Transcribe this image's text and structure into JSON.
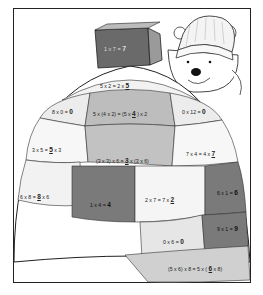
{
  "worksheet": {
    "frame": {
      "border_color": "#222222"
    },
    "book": {
      "equation": "1 x 7 = ",
      "answer": "7",
      "color": "#6a6a6a"
    },
    "bear": {
      "description": "bear in knit hat holding book"
    },
    "blocks": [
      {
        "id": "r1c1",
        "equation_pre": "5 x 2 = 2 x ",
        "answer": "5",
        "equation_post": "",
        "shade": "#f2f2f2"
      },
      {
        "id": "r2c1",
        "equation_pre": "8 x 0 = ",
        "answer": "0",
        "equation_post": "",
        "shade": "#ececec"
      },
      {
        "id": "r2c2",
        "equation_pre": "5 x (4 x 2) = (5 x ",
        "answer": "4",
        "equation_post": " ) x 2",
        "shade": "#bdbdbd"
      },
      {
        "id": "r2c3",
        "equation_pre": "0 x 12 = ",
        "answer": "0",
        "equation_post": "",
        "shade": "#ececec"
      },
      {
        "id": "r3c1",
        "equation_pre": "3 x 5 = ",
        "answer": "5",
        "equation_post": " x 3",
        "shade": "#f7f7f7"
      },
      {
        "id": "r3c2",
        "equation_pre": "(3 x 3) x 6 = ",
        "answer": "3",
        "equation_post": " x (3 x 6)",
        "shade": "#c2c2c2"
      },
      {
        "id": "r3c3",
        "equation_pre": "7 x 4 = 4 x ",
        "answer": "7",
        "equation_post": "",
        "shade": "#f7f7f7"
      },
      {
        "id": "r4c1",
        "equation_pre": "6 x 8 = ",
        "answer": "8",
        "equation_post": " x 6",
        "shade": "#f2f2f2"
      },
      {
        "id": "r4c2",
        "equation_pre": "1 x 4 = ",
        "answer": "4",
        "equation_post": "",
        "shade": "#7a7a7a"
      },
      {
        "id": "r4c3",
        "equation_pre": "2 x 7 = 7 x ",
        "answer": "2",
        "equation_post": "",
        "shade": "#f5f5f5"
      },
      {
        "id": "r4c4",
        "equation_pre": "6 x 1 = ",
        "answer": "6",
        "equation_post": "",
        "shade": "#7a7a7a"
      },
      {
        "id": "r5c1",
        "equation_pre": "0 x 6 = ",
        "answer": "0",
        "equation_post": "",
        "shade": "#e6e6e6"
      },
      {
        "id": "r5c2",
        "equation_pre": "9 x 1 = ",
        "answer": "9",
        "equation_post": "",
        "shade": "#7a7a7a"
      },
      {
        "id": "r6c1",
        "equation_pre": "(5 x 6) x 8 = 5 x ( ",
        "answer": "6",
        "equation_post": " x 8)",
        "shade": "#d0d0d0"
      }
    ]
  }
}
